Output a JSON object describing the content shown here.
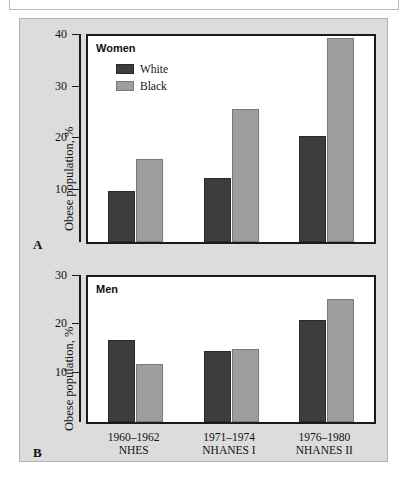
{
  "figure": {
    "panel_a_letter": "A",
    "panel_b_letter": "B",
    "y_axis_title": "Obese population, %"
  },
  "legend": {
    "series": [
      {
        "name": "White",
        "color": "#3d3d3d"
      },
      {
        "name": "Black",
        "color": "#9e9e9e"
      }
    ]
  },
  "x_groups": [
    {
      "period": "1960–1962",
      "survey": "NHES"
    },
    {
      "period": "1971–1974",
      "survey": "NHANES I"
    },
    {
      "period": "1976–1980",
      "survey": "NHANES II"
    }
  ],
  "chart_data": [
    {
      "type": "bar",
      "panel": "A",
      "title": "Women",
      "categories": [
        "1960–1962 NHES",
        "1971–1974 NHANES I",
        "1976–1980 NHANES II"
      ],
      "series": [
        {
          "name": "White",
          "values": [
            10.1,
            12.5,
            20.8
          ],
          "color": "#3d3d3d"
        },
        {
          "name": "Black",
          "values": [
            16.3,
            26.0,
            40.0
          ],
          "color": "#9e9e9e"
        }
      ],
      "xlabel": "",
      "ylabel": "Obese population, %",
      "ylim": [
        0,
        40
      ],
      "yticks": [
        10,
        20,
        30,
        40
      ],
      "grid": false,
      "legend_position": "top-left"
    },
    {
      "type": "bar",
      "panel": "B",
      "title": "Men",
      "categories": [
        "1960–1962 NHES",
        "1971–1974 NHANES I",
        "1976–1980 NHANES II"
      ],
      "series": [
        {
          "name": "White",
          "values": [
            17.2,
            15.0,
            21.3
          ],
          "color": "#3d3d3d"
        },
        {
          "name": "Black",
          "values": [
            12.1,
            15.3,
            25.8
          ],
          "color": "#9e9e9e"
        }
      ],
      "xlabel": "",
      "ylabel": "Obese population, %",
      "ylim": [
        0,
        30
      ],
      "yticks": [
        10,
        20,
        30
      ],
      "grid": false,
      "legend_position": "none"
    }
  ]
}
